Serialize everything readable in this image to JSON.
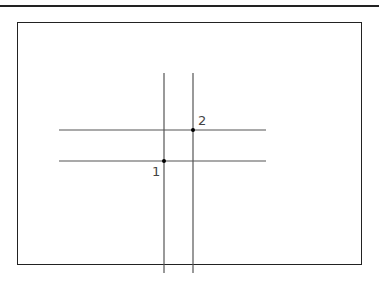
{
  "diagram": {
    "horizontal_lines": [
      {
        "x1": 59,
        "x2": 266,
        "y": 130
      },
      {
        "x1": 59,
        "x2": 266,
        "y": 161
      }
    ],
    "vertical_lines": [
      {
        "x": 164,
        "y1": 73,
        "y2": 273
      },
      {
        "x": 193,
        "y1": 73,
        "y2": 273
      }
    ],
    "points": [
      {
        "label": "1",
        "x": 164,
        "y": 161
      },
      {
        "label": "2",
        "x": 193,
        "y": 130
      }
    ],
    "line_color": "#555555",
    "frame_color": "#222222"
  }
}
